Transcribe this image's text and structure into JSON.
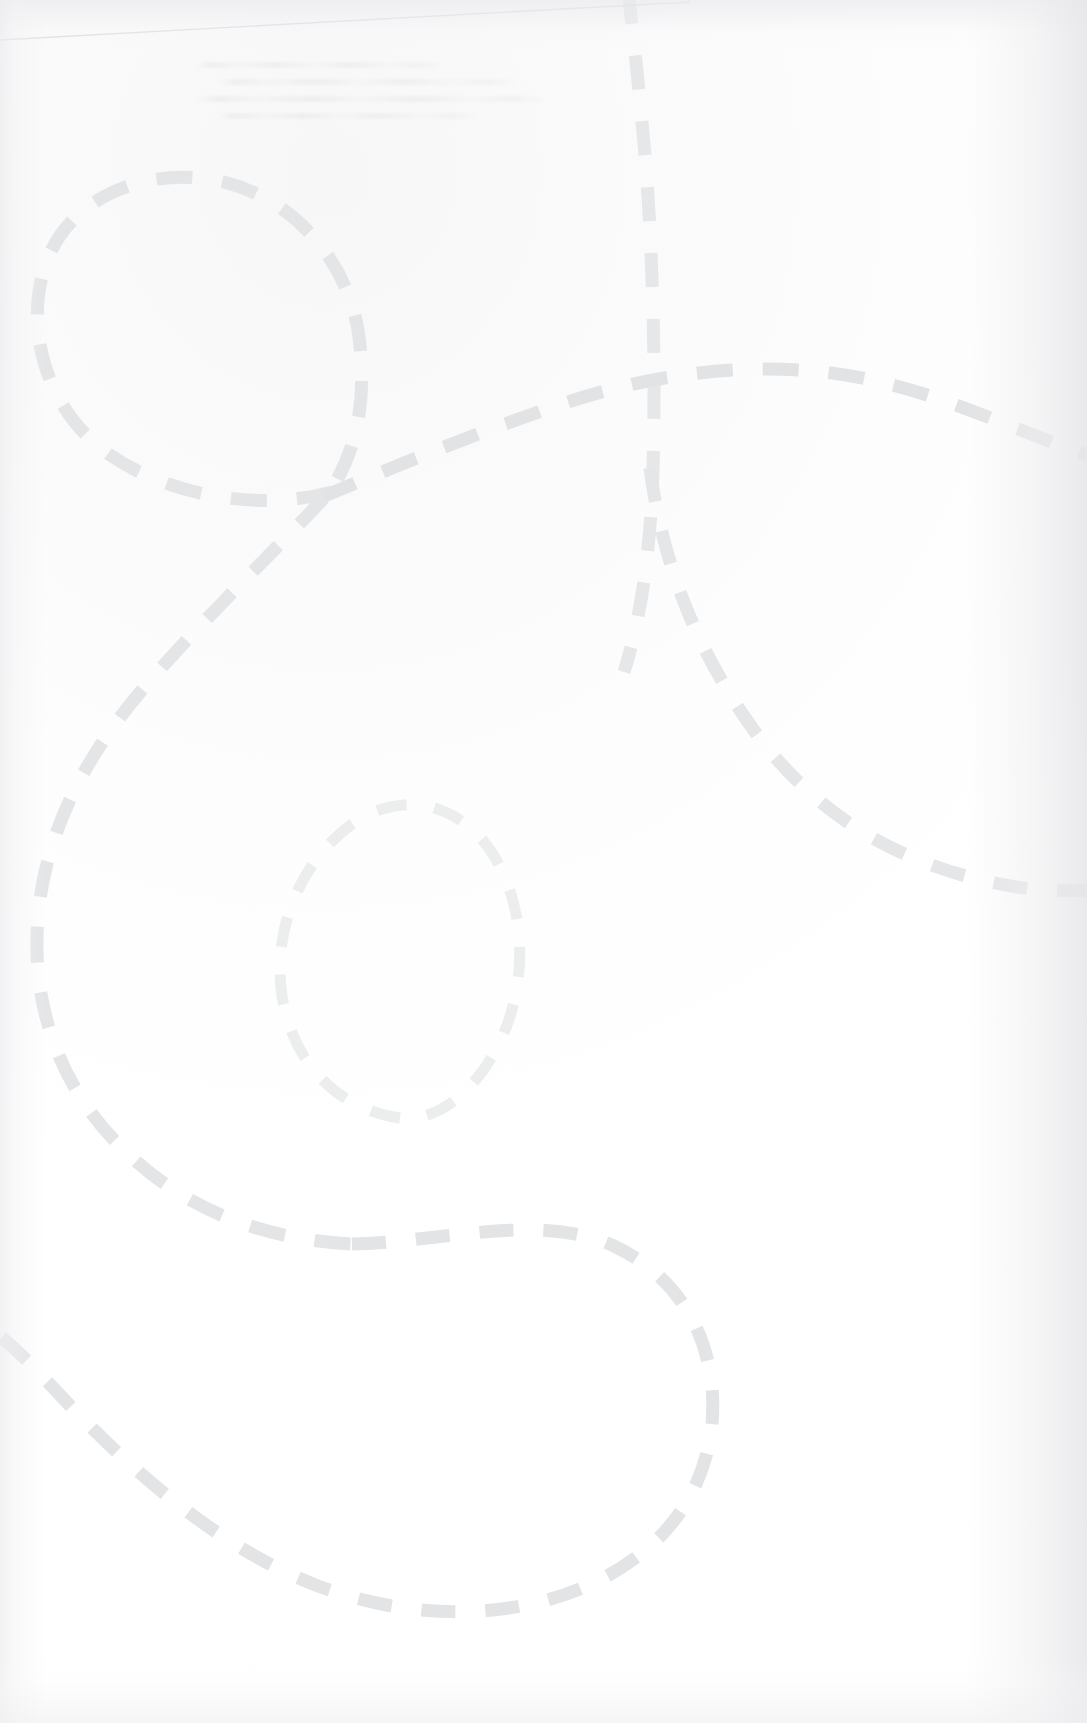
{
  "page": {
    "width": 1087,
    "height": 1723,
    "background_color": "#fefefe",
    "paper_tint": "#fbfbfc"
  },
  "artwork": {
    "name": "dashed-looping-path",
    "description": "A large hand-drawn style dashed line that loops twice and snakes across a blank scanned page",
    "stroke_color_primary": "#e3e4e6",
    "stroke_color_secondary": "#ececee",
    "stroke_color_faint": "#f0f1f2",
    "stroke_width_primary": 13,
    "stroke_width_secondary": 11,
    "dash_pattern_primary": "34 30",
    "dash_pattern_secondary": "30 28",
    "segments": [
      {
        "name": "upper-left-loop",
        "color": "#e4e5e7",
        "width": 13,
        "dash": "36 30",
        "d": "M 332 492 C 268 510 176 500 110 455 C 44 410 22 322 48 258 C 74 194 150 168 214 180 C 290 194 346 258 358 330 C 370 408 352 462 324 500"
      },
      {
        "name": "vertical-branch-top",
        "color": "#e6e7e9",
        "width": 13,
        "dash": "34 32",
        "d": "M 628 -10 C 636 60 646 150 650 230 C 654 312 655 390 653 470 C 650 560 640 620 624 672"
      },
      {
        "name": "main-crossing-sweep",
        "color": "#e2e3e5",
        "width": 13,
        "dash": "36 30",
        "d": "M 322 497 C 386 470 468 436 556 406 C 660 370 772 358 872 380 C 952 398 1010 428 1087 455"
      },
      {
        "name": "right-descending-arc",
        "color": "#e5e6e8",
        "width": 13,
        "dash": "34 30",
        "d": "M 650 468 C 662 560 694 644 748 722 C 806 806 888 862 1000 884 C 1030 890 1060 892 1087 890"
      },
      {
        "name": "left-long-descent",
        "color": "#e4e5e7",
        "width": 13,
        "dash": "36 30",
        "d": "M 324 498 C 266 560 202 620 142 690 C 82 760 44 838 38 918 C 30 1010 64 1094 126 1152 C 188 1212 268 1240 352 1244"
      },
      {
        "name": "inner-small-loop",
        "color": "#eceded",
        "width": 11,
        "dash": "30 28",
        "d": "M 400 1118 C 338 1110 292 1062 282 996 C 272 930 300 862 352 824 C 404 788 462 804 494 856 C 528 912 528 990 496 1050 C 466 1104 428 1122 398 1118"
      },
      {
        "name": "bottom-s-curve",
        "color": "#e3e4e6",
        "width": 13,
        "dash": "34 30",
        "d": "M 352 1244 C 444 1242 540 1212 614 1246 C 690 1282 718 1354 712 1424 C 704 1500 658 1556 582 1588 C 500 1622 404 1618 318 1586 C 230 1552 150 1488 76 1412 C 46 1380 22 1354 0 1336"
      }
    ]
  },
  "page_edge": {
    "name": "scan-edge-line",
    "color": "#d5d6d9",
    "description": "Faint slanted line across the top, the edge of the scanned sheet",
    "x1": 0,
    "y1": 40,
    "x2": 690,
    "y2": 2
  },
  "ghost_text": {
    "name": "faded-scan-residue",
    "description": "Illegible faded text remnants near the top of the page",
    "lines": 4,
    "top": 62,
    "left": 196,
    "width": 400
  }
}
